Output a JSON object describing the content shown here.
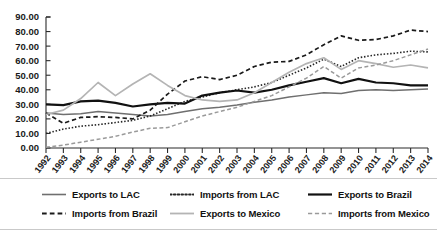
{
  "chart_data": {
    "type": "line",
    "title": "",
    "subtitle": "",
    "xlabel": "",
    "ylabel": "",
    "grid": false,
    "legend_position": "bottom",
    "xlim": [
      1992,
      2014
    ],
    "ylim": [
      0,
      90
    ],
    "ytick_labels": [
      "0.00",
      "10.00",
      "20.00",
      "30.00",
      "40.00",
      "50.00",
      "60.00",
      "70.00",
      "80.00",
      "90.00"
    ],
    "ytick_values": [
      0,
      10,
      20,
      30,
      40,
      50,
      60,
      70,
      80,
      90
    ],
    "x": [
      1992,
      1993,
      1994,
      1995,
      1996,
      1997,
      1998,
      1999,
      2000,
      2001,
      2002,
      2003,
      2004,
      2005,
      2006,
      2007,
      2008,
      2009,
      2010,
      2011,
      2012,
      2013,
      2014
    ],
    "categories": [
      "1992",
      "1993",
      "1994",
      "1995",
      "1996",
      "1997",
      "1998",
      "1999",
      "2000",
      "2001",
      "2002",
      "2003",
      "2004",
      "2005",
      "2006",
      "2007",
      "2008",
      "2009",
      "2010",
      "2011",
      "2012",
      "2013",
      "2014"
    ],
    "series": [
      {
        "name": "Exports to LAC",
        "color": "#6f6f6f",
        "width": 1.5,
        "dash": "none",
        "values": [
          24.0,
          23.0,
          23.5,
          25.0,
          24.0,
          23.0,
          22.0,
          23.0,
          25.0,
          27.0,
          28.0,
          29.5,
          31.5,
          33.0,
          35.0,
          36.5,
          38.0,
          37.5,
          39.5,
          40.0,
          39.5,
          40.0,
          40.5
        ]
      },
      {
        "name": "Imports from LAC",
        "color": "#262626",
        "width": 1.6,
        "dash": "dotted",
        "values": [
          10.0,
          13.0,
          15.0,
          16.0,
          17.5,
          19.0,
          22.0,
          27.0,
          32.0,
          35.0,
          38.0,
          40.0,
          42.0,
          45.0,
          50.0,
          55.0,
          61.0,
          56.0,
          62.0,
          64.0,
          65.0,
          66.5,
          66.0
        ]
      },
      {
        "name": "Exports to Brazil",
        "color": "#111111",
        "width": 2.2,
        "dash": "none",
        "values": [
          30.0,
          29.5,
          32.0,
          32.5,
          31.0,
          28.5,
          30.0,
          31.0,
          30.5,
          36.0,
          38.0,
          39.5,
          38.0,
          40.0,
          43.0,
          45.5,
          48.0,
          44.5,
          47.5,
          45.0,
          44.5,
          43.0,
          43.0
        ]
      },
      {
        "name": "Imports from Brazil",
        "color": "#1a1a1a",
        "width": 1.7,
        "dash": "dashed",
        "values": [
          24.0,
          17.0,
          21.0,
          21.5,
          21.0,
          20.0,
          26.0,
          37.0,
          46.0,
          49.0,
          47.0,
          50.0,
          56.0,
          59.0,
          59.5,
          64.0,
          71.0,
          77.0,
          74.0,
          74.5,
          77.0,
          81.0,
          80.0
        ]
      },
      {
        "name": "Exports to Mexico",
        "color": "#b4b4b4",
        "width": 1.7,
        "dash": "none",
        "values": [
          23.0,
          26.0,
          34.0,
          45.0,
          36.0,
          44.0,
          51.0,
          43.0,
          36.0,
          33.0,
          32.0,
          33.0,
          38.0,
          45.0,
          52.0,
          58.0,
          62.0,
          54.0,
          60.0,
          58.0,
          55.5,
          57.0,
          55.0
        ]
      },
      {
        "name": "Imports from Mexico",
        "color": "#9a9a9a",
        "width": 1.5,
        "dash": "dashed",
        "values": [
          0.5,
          2.0,
          4.0,
          6.0,
          8.0,
          11.0,
          13.5,
          14.0,
          18.0,
          22.0,
          25.0,
          28.0,
          32.0,
          36.0,
          42.0,
          48.0,
          56.0,
          48.0,
          55.0,
          57.0,
          60.0,
          64.0,
          68.0
        ]
      }
    ]
  },
  "legend": {
    "row1": [
      {
        "label": "Exports to LAC",
        "color": "#6f6f6f",
        "dash": "none",
        "width": 1.6
      },
      {
        "label": "Imports from LAC",
        "color": "#262626",
        "dash": "dotted",
        "width": 1.8
      },
      {
        "label": "Exports to Brazil",
        "color": "#111111",
        "dash": "none",
        "width": 2.2
      }
    ],
    "row2": [
      {
        "label": "Imports from Brazil",
        "color": "#1a1a1a",
        "dash": "dashed",
        "width": 1.8
      },
      {
        "label": "Exports to Mexico",
        "color": "#b4b4b4",
        "dash": "none",
        "width": 1.8
      },
      {
        "label": "Imports from Mexico",
        "color": "#9a9a9a",
        "dash": "dashed",
        "width": 1.6
      }
    ]
  }
}
